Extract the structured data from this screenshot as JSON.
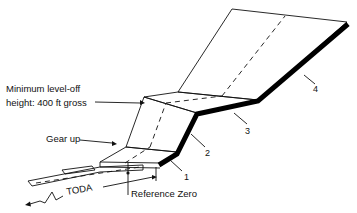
{
  "diagram": {
    "labels": {
      "level_off_line1": "Minimum level-off",
      "level_off_line2": "height: 400 ft gross",
      "gear_up": "Gear up",
      "toda": "TODA",
      "reference_zero": "Reference Zero"
    },
    "segments": [
      {
        "id": "1",
        "label": "1"
      },
      {
        "id": "2",
        "label": "2"
      },
      {
        "id": "3",
        "label": "3"
      },
      {
        "id": "4",
        "label": "4"
      }
    ],
    "colors": {
      "line": "#111111",
      "flight_path": "#000000",
      "background": "#ffffff"
    }
  }
}
